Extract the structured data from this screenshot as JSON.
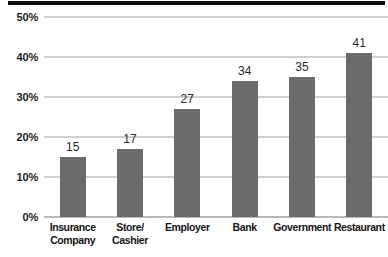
{
  "chart_data": {
    "type": "bar",
    "title": "",
    "xlabel": "",
    "ylabel": "",
    "categories": [
      "Insurance\nCompany",
      "Store/\nCashier",
      "Employer",
      "Bank",
      "Government",
      "Restaurant"
    ],
    "values": [
      15,
      17,
      27,
      34,
      35,
      41
    ],
    "data_labels": [
      "15",
      "17",
      "27",
      "34",
      "35",
      "41"
    ],
    "ylim": [
      0,
      50
    ],
    "yticks": [
      0,
      10,
      20,
      30,
      40,
      50
    ],
    "ytick_labels": [
      "0%",
      "10%",
      "20%",
      "30%",
      "40%",
      "50%"
    ],
    "grid": true,
    "grid_axis": "y",
    "legend": false,
    "legend_position": "none",
    "value_unit": "%"
  },
  "colors": {
    "bar": "#6b6b6b",
    "gridline": "#cfcfcf",
    "baseline": "#b9b9b9",
    "background": "#ffffff",
    "tick_text": "#1a1a1a",
    "label_text": "#141414",
    "value_text": "#2b2b2b",
    "top_band": "#0c0c0c"
  }
}
